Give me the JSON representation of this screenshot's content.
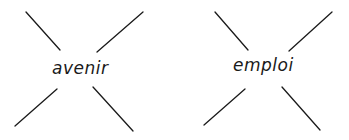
{
  "diagrams": [
    {
      "label": "avenir",
      "lines": [
        {
          "x1": 26,
          "y1": 12,
          "x2": 60,
          "y2": 50
        },
        {
          "x1": 143,
          "y1": 12,
          "x2": 97,
          "y2": 52
        },
        {
          "x1": 57,
          "y1": 89,
          "x2": 15,
          "y2": 126
        },
        {
          "x1": 93,
          "y1": 87,
          "x2": 133,
          "y2": 131
        }
      ]
    },
    {
      "label": "emploi",
      "lines": [
        {
          "x1": 215,
          "y1": 12,
          "x2": 248,
          "y2": 50
        },
        {
          "x1": 332,
          "y1": 12,
          "x2": 289,
          "y2": 51
        },
        {
          "x1": 245,
          "y1": 89,
          "x2": 204,
          "y2": 125
        },
        {
          "x1": 282,
          "y1": 87,
          "x2": 320,
          "y2": 130
        }
      ]
    }
  ],
  "colors": {
    "stroke": "#1a1a1a",
    "background": "#ffffff"
  }
}
